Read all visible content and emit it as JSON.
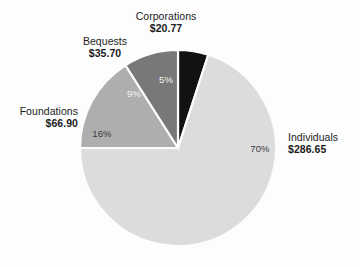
{
  "chart_data": {
    "type": "pie",
    "title": "",
    "subtitle": "",
    "xlabel": "",
    "ylabel": "",
    "legend_position": "none",
    "grid": false,
    "value_prefix": "$",
    "total": 409.02,
    "categories": [
      "Individuals",
      "Foundations",
      "Bequests",
      "Corporations"
    ],
    "values": [
      286.65,
      66.9,
      35.7,
      20.77
    ],
    "percentages": [
      70,
      16,
      9,
      5
    ],
    "colors": [
      "#dcdcdc",
      "#aeaeae",
      "#787878",
      "#121212"
    ],
    "slices": [
      {
        "label": "Individuals",
        "value_text": "$286.65",
        "value": 286.65,
        "percent": 70,
        "percent_text": "70%",
        "color": "#dcdcdc",
        "percent_text_color": "#3b3b3b"
      },
      {
        "label": "Foundations",
        "value_text": "$66.90",
        "value": 66.9,
        "percent": 16,
        "percent_text": "16%",
        "color": "#aeaeae",
        "percent_text_color": "#3b3b3b"
      },
      {
        "label": "Bequests",
        "value_text": "$35.70",
        "value": 35.7,
        "percent": 9,
        "percent_text": "9%",
        "color": "#787878",
        "percent_text_color": "#f2f2f2"
      },
      {
        "label": "Corporations",
        "value_text": "$20.77",
        "value": 20.77,
        "percent": 5,
        "percent_text": "5%",
        "color": "#121212",
        "percent_text_color": "#f2f2f2"
      }
    ]
  },
  "figure": {
    "background": "#fdfdfd",
    "separator_color": "#fdfdfd"
  }
}
